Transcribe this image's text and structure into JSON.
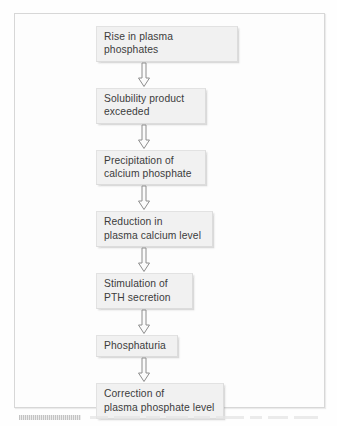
{
  "figure": {
    "background_color": "#fdfdfd",
    "frame_border_color": "#d7d7d7",
    "box_fill_color": "#f1f1f1",
    "box_border_color": "#e2e2e2",
    "text_color": "#3c3c3c",
    "arrow_outline_color": "#8e8e8e",
    "arrow_fill_color": "#fbfbfb"
  },
  "flow": {
    "steps": [
      {
        "id": "rise-in-plasma-phosphates",
        "label": "Rise in plasma phosphates",
        "lines": 1,
        "width_px": 142
      },
      {
        "id": "solubility-product-exceeded",
        "label": "Solubility product\nexceeded",
        "lines": 2,
        "width_px": 110
      },
      {
        "id": "precipitation-of-calcium-phosphate",
        "label": "Precipitation of\ncalcium phosphate",
        "lines": 2,
        "width_px": 110
      },
      {
        "id": "reduction-in-plasma-calcium-level",
        "label": "Reduction in\nplasma calcium level",
        "lines": 2,
        "width_px": 117
      },
      {
        "id": "stimulation-of-pth-secretion",
        "label": "Stimulation of\nPTH secretion",
        "lines": 2,
        "width_px": 97
      },
      {
        "id": "phosphaturia",
        "label": "Phosphaturia",
        "lines": 1,
        "width_px": 82
      },
      {
        "id": "correction-of-plasma-phosphate-level",
        "label": "Correction of\nplasma phosphate level",
        "lines": 2,
        "width_px": 128
      }
    ],
    "connectors": [
      {
        "id": "arrow-1",
        "from": "rise-in-plasma-phosphates",
        "to": "solubility-product-exceeded",
        "direction": "down"
      },
      {
        "id": "arrow-2",
        "from": "solubility-product-exceeded",
        "to": "precipitation-of-calcium-phosphate",
        "direction": "down"
      },
      {
        "id": "arrow-3",
        "from": "precipitation-of-calcium-phosphate",
        "to": "reduction-in-plasma-calcium-level",
        "direction": "down"
      },
      {
        "id": "arrow-4",
        "from": "reduction-in-plasma-calcium-level",
        "to": "stimulation-of-pth-secretion",
        "direction": "down"
      },
      {
        "id": "arrow-5",
        "from": "stimulation-of-pth-secretion",
        "to": "phosphaturia",
        "direction": "down"
      },
      {
        "id": "arrow-6",
        "from": "phosphaturia",
        "to": "correction-of-plasma-phosphate-level",
        "direction": "down"
      }
    ]
  },
  "caption": {
    "visible_text": "",
    "note": "cropped illegible caption strip"
  }
}
